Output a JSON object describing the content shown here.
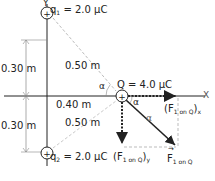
{
  "diagram": {
    "axes": {
      "x_label": "X",
      "y_label": "Y"
    },
    "charges": {
      "q1": {
        "name": "q",
        "subscript": "1",
        "value_text": "= 2.0 μC",
        "sign": "+"
      },
      "q2": {
        "name": "q",
        "subscript": "2",
        "value_text": "= 2.0 μC",
        "sign": "+"
      },
      "Q": {
        "label": "Q = 4.0 μC",
        "sign": "+"
      }
    },
    "dimensions": {
      "upper_vertical": "0.30 m",
      "lower_vertical": "0.30 m",
      "horizontal": "0.40 m",
      "upper_diagonal": "0.50 m",
      "lower_diagonal": "0.50 m"
    },
    "angles": {
      "alpha_left": "α",
      "alpha_right": "α",
      "alpha_vector": "α"
    },
    "forces": {
      "x_component": {
        "main": "(F",
        "sub": "1 on Q",
        "close": ")",
        "axis": "x"
      },
      "y_component": {
        "main": "(F",
        "sub": "1 on Q",
        "close": ")",
        "axis": "y"
      },
      "vector": {
        "main": "F",
        "sub": "1 on Q"
      }
    },
    "colors": {
      "ink": "#222222",
      "dashed": "#aaaaaa"
    }
  }
}
